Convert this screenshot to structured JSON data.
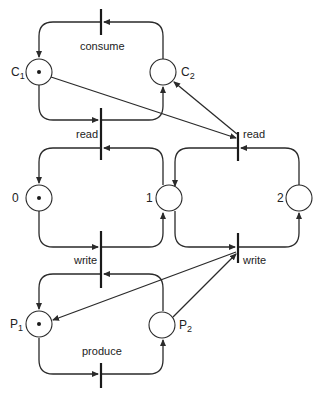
{
  "diagram": {
    "type": "petri-net",
    "places": {
      "c1": {
        "label": "C",
        "sub": "1",
        "token": true
      },
      "c2": {
        "label": "C",
        "sub": "2",
        "token": false
      },
      "p0": {
        "label": "0",
        "token": true
      },
      "p1": {
        "label": "1",
        "token": false
      },
      "p2": {
        "label": "2",
        "token": false
      },
      "pp1": {
        "label": "P",
        "sub": "1",
        "token": true
      },
      "pp2": {
        "label": "P",
        "sub": "2",
        "token": false
      }
    },
    "transitions": {
      "consume": "consume",
      "read_left": "read",
      "read_right": "read",
      "write_left": "write",
      "write_right": "write",
      "produce": "produce"
    },
    "colors": {
      "stroke": "#2a2a2a",
      "background": "#ffffff"
    }
  }
}
